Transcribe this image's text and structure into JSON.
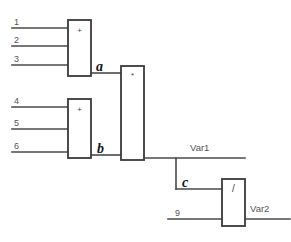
{
  "diagram": {
    "canvas": {
      "width": 291,
      "height": 242,
      "background": "#ffffff"
    },
    "colors": {
      "wire": "#4a4a4a",
      "block_border": "#3a3a3a",
      "block_fill": "#ffffff",
      "label_text": "#555555",
      "signal_text": "#151515"
    },
    "blocks": [
      {
        "id": "sum-a",
        "operator": "+",
        "x": 68,
        "y": 20,
        "width": 23,
        "height": 56,
        "output_signal": "a"
      },
      {
        "id": "sum-b",
        "operator": "+",
        "x": 68,
        "y": 99,
        "width": 23,
        "height": 59,
        "output_signal": "b"
      },
      {
        "id": "multiply",
        "operator": "*",
        "x": 121,
        "y": 66,
        "width": 23,
        "height": 94,
        "output_signal": "Var1"
      },
      {
        "id": "divide",
        "operator": "/",
        "x": 222,
        "y": 179,
        "width": 23,
        "height": 47,
        "output_signal": "Var2"
      }
    ],
    "inputs": [
      {
        "label": "1",
        "target": "sum-a",
        "y": 28
      },
      {
        "label": "2",
        "target": "sum-a",
        "y": 46
      },
      {
        "label": "3",
        "target": "sum-a",
        "y": 65
      },
      {
        "label": "4",
        "target": "sum-b",
        "y": 107
      },
      {
        "label": "5",
        "target": "sum-b",
        "y": 129
      },
      {
        "label": "6",
        "target": "sum-b",
        "y": 152
      },
      {
        "label": "9",
        "target": "divide",
        "y": 219
      }
    ],
    "signals": [
      {
        "label": "a",
        "from": "sum-a",
        "to": "multiply"
      },
      {
        "label": "b",
        "from": "sum-b",
        "to": "multiply"
      },
      {
        "label": "c",
        "from": "multiply",
        "to": "divide"
      }
    ],
    "outputs": [
      {
        "label": "Var1",
        "from": "multiply"
      },
      {
        "label": "Var2",
        "from": "divide"
      }
    ]
  }
}
